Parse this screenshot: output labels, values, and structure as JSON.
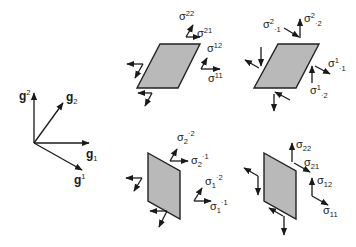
{
  "colors": {
    "ink": "#1a1a1a",
    "panel_fill": "#b9b9b9",
    "panel_stroke": "#222222",
    "background": "#ffffff"
  },
  "basis": {
    "g_sup2": {
      "base": "g",
      "sup": "2"
    },
    "g_sub2": {
      "base": "g",
      "sub": "2"
    },
    "g_sub1": {
      "base": "g",
      "sub": "1"
    },
    "g_sup1": {
      "base": "g",
      "sup": "1"
    }
  },
  "panels": {
    "top_left": {
      "title": "contravariant stress components on oblique element",
      "labels": {
        "s22": {
          "base": "σ",
          "sup": "22"
        },
        "s21": {
          "base": "σ",
          "sup": "21"
        },
        "s12": {
          "base": "σ",
          "sup": "12"
        },
        "s11": {
          "base": "σ",
          "sup": "11"
        }
      }
    },
    "top_right": {
      "labels": {
        "s2_1": {
          "base": "σ",
          "sup": "2",
          "sub": "·1"
        },
        "s2_2": {
          "base": "σ",
          "sup": "2",
          "sub": "·2"
        },
        "s1_1": {
          "base": "σ",
          "sup": "1",
          "sub": "·1"
        },
        "s1_2": {
          "base": "σ",
          "sup": "1",
          "sub": "·2"
        }
      }
    },
    "bottom_left": {
      "labels": {
        "s2_2": {
          "base": "σ",
          "sub": "2",
          "sup": "·2"
        },
        "s2_1": {
          "base": "σ",
          "sub": "2",
          "sup": "·1"
        },
        "s1_2": {
          "base": "σ",
          "sub": "1",
          "sup": "·2"
        },
        "s1_1": {
          "base": "σ",
          "sub": "1",
          "sup": "·1"
        }
      }
    },
    "bottom_right": {
      "labels": {
        "s22": {
          "base": "σ",
          "sub": "22"
        },
        "s21": {
          "base": "σ",
          "sub": "21"
        },
        "s12": {
          "base": "σ",
          "sub": "12"
        },
        "s11": {
          "base": "σ",
          "sub": "11"
        }
      }
    }
  }
}
